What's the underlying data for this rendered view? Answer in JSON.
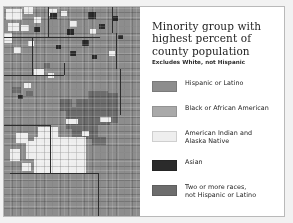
{
  "figure": {
    "title": "Minority group with highest percent of county population",
    "subtitle": "Excludes White, not Hispanic"
  },
  "legend": {
    "items": [
      {
        "label": "Hispanic or Latino",
        "color": "#8d8d8d",
        "key": "hispanic-or-latino"
      },
      {
        "label": "Black or African American",
        "color": "#a9a9a9",
        "key": "black-or-african-american"
      },
      {
        "label": "American Indian and\nAlaska Native",
        "color": "#eeeeee",
        "key": "american-indian-and-alaska-native"
      },
      {
        "label": "Asian",
        "color": "#2b2b2b",
        "key": "asian"
      },
      {
        "label": "Two or more races,\nnot Hispanic or Latino",
        "color": "#6d6d6d",
        "key": "two-or-more-races"
      }
    ]
  },
  "map": {
    "background_color": "#8d8d8d",
    "border_color": "#2d2d2d",
    "panel_color": "#ffffff",
    "frame_color": "#b9b9b9"
  }
}
